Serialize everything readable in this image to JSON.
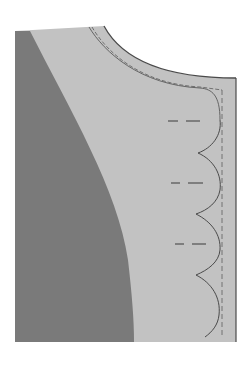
{
  "figure": {
    "title": "",
    "colors": {
      "background": "#ffffff",
      "fabric_light": "#c2c2c2",
      "fabric_dark": "#7a7a7a",
      "stroke": "#555555"
    },
    "parts": {
      "dark_panel": "lining / wrong side",
      "light_panel": "facing / right side",
      "neckline": "curved neckline edge",
      "seam_allowance": "dashed stitching line",
      "scallops": "scalloped placket edge",
      "buttonholes": [
        {
          "y": 121
        },
        {
          "y": 183
        },
        {
          "y": 244
        }
      ]
    }
  }
}
